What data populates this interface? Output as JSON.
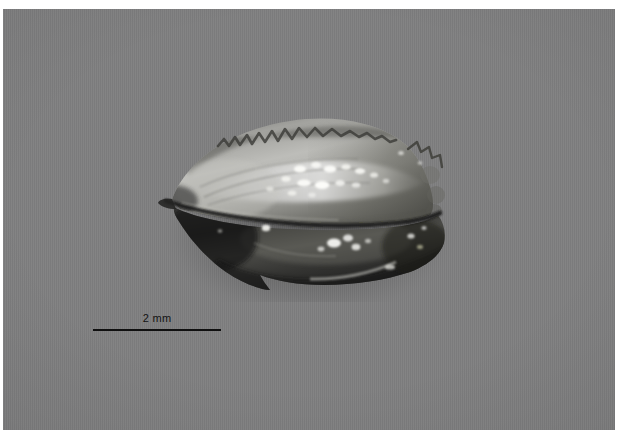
{
  "figure": {
    "kind": "macro-photograph",
    "background_color": "#7f7f80",
    "plate_border_color": "#ffffff"
  },
  "scale_bar": {
    "label": "2 mm",
    "value": 2,
    "unit": "mm",
    "line_color": "#101010",
    "label_color": "#131313",
    "line_length_px": 128,
    "position": "lower-left"
  },
  "specimen": {
    "name": "specimen",
    "orientation": "lateral view, anterior to the left",
    "upper_valve": {
      "name": "upper-valve",
      "tone": "light grey, strongly lit",
      "margin": "crenulated / serrated dorsal margin",
      "highlights": "rows of bright specular dots along the central ridge",
      "fill_light": "#b9b9b7",
      "fill_dark": "#6a6a68"
    },
    "lower_valve": {
      "name": "lower-valve",
      "tone": "dark, shadowed",
      "margin": "angular ventral keel",
      "highlights": "scattered bright specular spots",
      "fill_light": "#5a5a58",
      "fill_dark": "#1b1b1b"
    },
    "gape": {
      "name": "valve-gape",
      "description": "dark commissure line separating the two valves"
    },
    "posterior": {
      "name": "posterior-margin",
      "description": "knobby, tuberculate right end"
    },
    "anterior": {
      "name": "anterior-margin",
      "description": "pointed left end"
    }
  }
}
